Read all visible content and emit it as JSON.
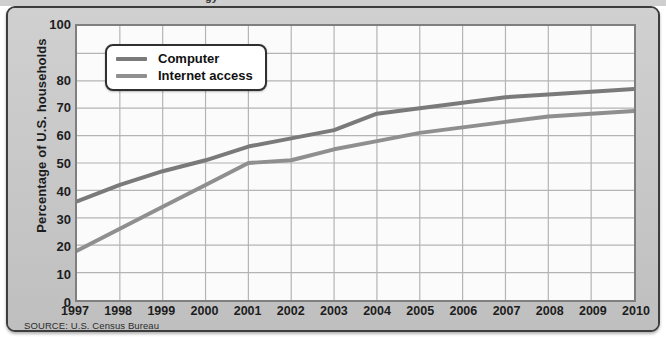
{
  "figure": {
    "source_note": "SOURCE: U.S. Census Bureau",
    "top_cut_fragment": "gy",
    "frame_color": "#3d3d3d",
    "panel_color": "#c9c9c9",
    "plot_bg_color": "#fbfbfb"
  },
  "legend": {
    "position": "top-left",
    "entries": [
      {
        "label": "Computer",
        "color": "#7a7a7a"
      },
      {
        "label": "Internet access",
        "color": "#8f8f8f"
      }
    ]
  },
  "chart_data": {
    "type": "line",
    "title": "",
    "subtitle": "",
    "xlabel": "",
    "ylabel": "Percentage of U.S. households",
    "x": [
      1997,
      1998,
      1999,
      2000,
      2001,
      2002,
      2003,
      2004,
      2005,
      2006,
      2007,
      2008,
      2009,
      2010
    ],
    "categories": [
      "1997",
      "1998",
      "1999",
      "2000",
      "2001",
      "2002",
      "2003",
      "2004",
      "2005",
      "2006",
      "2007",
      "2008",
      "2009",
      "2010"
    ],
    "xlim": [
      1997,
      2010
    ],
    "ylim": [
      0,
      100
    ],
    "yticks": [
      0,
      10,
      20,
      30,
      40,
      50,
      60,
      70,
      80,
      100
    ],
    "ytick_labels": [
      "0",
      "10",
      "20",
      "30",
      "40",
      "50",
      "60",
      "70",
      "80",
      "100"
    ],
    "grid": true,
    "grid_color": "#b4b4b4",
    "legend_position": "top-left",
    "series": [
      {
        "name": "Computer",
        "color": "#7a7a7a",
        "values": [
          36,
          42,
          47,
          51,
          56,
          59,
          62,
          68,
          70,
          72,
          74,
          75,
          76,
          77
        ]
      },
      {
        "name": "Internet access",
        "color": "#8f8f8f",
        "values": [
          18,
          26,
          34,
          42,
          50,
          51,
          55,
          58,
          61,
          63,
          65,
          67,
          68,
          69
        ]
      }
    ],
    "annotations": [],
    "source": "U.S. Census Bureau"
  }
}
